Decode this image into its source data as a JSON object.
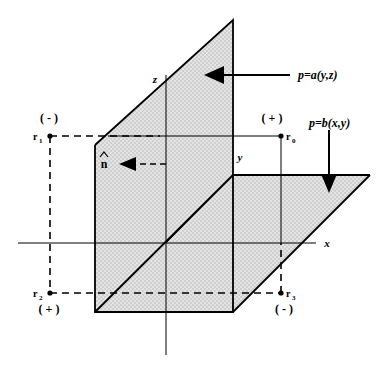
{
  "figure": {
    "type": "geometry-diagram",
    "background_color": "#ffffff",
    "plane_fill_color": "#d9d9d9",
    "line_color": "#000000"
  },
  "axes": {
    "x_label": "x",
    "y_label": "y",
    "z_label": "z"
  },
  "planes": [
    {
      "id": "vertical-plane",
      "label": "p=a(y,z)",
      "label_parts": {
        "lhs": "p",
        "eq": "=",
        "fn": "a",
        "args": "(y,z)"
      },
      "orientation": "vertical",
      "fill": "#d9d9d9"
    },
    {
      "id": "horizontal-plane",
      "label": "p=b(x,y)",
      "label_parts": {
        "lhs": "p",
        "eq": "=",
        "fn": "b",
        "args": "(x,y)"
      },
      "orientation": "horizontal",
      "fill": "#d9d9d9"
    }
  ],
  "normal": {
    "symbol": "n",
    "accent": "hat",
    "display": "n̂",
    "direction": "pointing left, negative x"
  },
  "points": [
    {
      "id": "r0",
      "base": "r",
      "subscript": "0",
      "sign": "( + )",
      "sign_position": "above"
    },
    {
      "id": "r1",
      "base": "r",
      "subscript": "1",
      "sign": "( - )",
      "sign_position": "above"
    },
    {
      "id": "r2",
      "base": "r",
      "subscript": "2",
      "sign": "( + )",
      "sign_position": "below"
    },
    {
      "id": "r3",
      "base": "r",
      "subscript": "3",
      "sign": "( - )",
      "sign_position": "below"
    }
  ],
  "signs": {
    "plus": "( + )",
    "minus": "( - )"
  },
  "annotations": {
    "arrow_to_vertical_plane": "solid arrow pointing left into the vertical plane",
    "arrow_to_horizontal_plane": "solid arrow pointing down onto the horizontal plane",
    "normal_arrow": "dashed line with solid arrowhead pointing left"
  }
}
